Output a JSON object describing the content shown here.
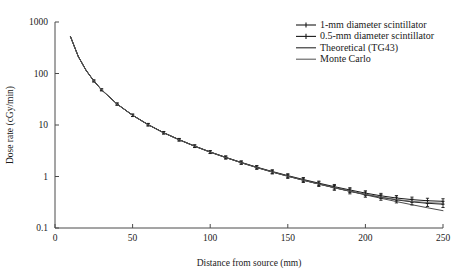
{
  "chart_data": {
    "type": "line",
    "title": "",
    "xlabel": "Distance from source (mm)",
    "ylabel": "Dose rate (cGy/min)",
    "xlim": [
      0,
      250
    ],
    "ylim": [
      0.1,
      1000
    ],
    "yscale": "log",
    "xscale": "linear",
    "grid": false,
    "xticks": [
      "0",
      "50",
      "100",
      "150",
      "200",
      "250"
    ],
    "xtick_values": [
      0,
      50,
      100,
      150,
      200,
      250
    ],
    "yticks": [
      "1000",
      "100",
      "10",
      "1",
      "0.1"
    ],
    "ytick_values": [
      1000,
      100,
      10,
      1,
      0.1
    ],
    "legend_position": "top-right",
    "legend": [
      "1-mm diameter scintillator",
      "0.5-mm diameter scintillator",
      "Theoretical (TG43)",
      "Monte Carlo"
    ],
    "series": [
      {
        "name": "1-mm diameter scintillator",
        "style": "line-with-errorbars",
        "color": "#1a1a1a",
        "x": [
          10,
          15,
          20,
          25,
          30,
          40,
          50,
          60,
          70,
          80,
          90,
          100,
          110,
          120,
          130,
          140,
          150,
          160,
          170,
          180,
          190,
          200,
          210,
          220,
          230,
          240,
          250
        ],
        "y": [
          520,
          215,
          116,
          72,
          48.5,
          25.6,
          15.5,
          10.2,
          7.1,
          5.2,
          3.9,
          3.0,
          2.36,
          1.88,
          1.52,
          1.25,
          1.04,
          0.875,
          0.742,
          0.635,
          0.548,
          0.476,
          0.422,
          0.382,
          0.356,
          0.338,
          0.33
        ],
        "yerr": [
          0,
          0,
          0,
          3.0,
          2.0,
          1.2,
          0.8,
          0.55,
          0.38,
          0.28,
          0.22,
          0.18,
          0.15,
          0.13,
          0.11,
          0.1,
          0.09,
          0.08,
          0.072,
          0.065,
          0.058,
          0.052,
          0.048,
          0.045,
          0.042,
          0.04,
          0.04
        ]
      },
      {
        "name": "0.5-mm diameter scintillator",
        "style": "line-with-errorbars",
        "color": "#1a1a1a",
        "x": [
          10,
          15,
          20,
          25,
          30,
          40,
          50,
          60,
          70,
          80,
          90,
          100,
          110,
          120,
          130,
          140,
          150,
          160,
          170,
          180,
          190,
          200,
          210,
          220,
          230,
          240,
          250
        ],
        "y": [
          515,
          213,
          115,
          71.5,
          48.0,
          25.4,
          15.4,
          10.1,
          7.05,
          5.15,
          3.87,
          2.97,
          2.33,
          1.85,
          1.49,
          1.22,
          1.01,
          0.845,
          0.712,
          0.605,
          0.518,
          0.448,
          0.394,
          0.352,
          0.322,
          0.302,
          0.29
        ],
        "yerr": [
          0,
          0,
          0,
          3.0,
          2.0,
          1.2,
          0.8,
          0.55,
          0.38,
          0.28,
          0.22,
          0.18,
          0.15,
          0.13,
          0.11,
          0.1,
          0.09,
          0.08,
          0.072,
          0.065,
          0.058,
          0.052,
          0.048,
          0.045,
          0.042,
          0.04,
          0.04
        ]
      },
      {
        "name": "Theoretical (TG43)",
        "style": "line",
        "color": "#2a2a2a",
        "x": [
          10,
          15,
          20,
          25,
          30,
          40,
          50,
          60,
          70,
          80,
          90,
          100,
          110,
          120,
          130,
          140,
          150,
          160,
          170,
          180,
          190,
          200,
          210,
          220,
          230,
          240,
          250
        ],
        "y": [
          518,
          214,
          115.5,
          71.8,
          48.2,
          25.5,
          15.45,
          10.15,
          7.08,
          5.18,
          3.88,
          2.98,
          2.34,
          1.86,
          1.5,
          1.23,
          1.02,
          0.852,
          0.716,
          0.606,
          0.516,
          0.44,
          0.378,
          0.326,
          0.283,
          0.247,
          0.217
        ]
      },
      {
        "name": "Monte Carlo",
        "style": "line",
        "color": "#5e5e5e",
        "x": [
          10,
          15,
          20,
          25,
          30,
          40,
          50,
          60,
          70,
          80,
          90,
          100,
          110,
          120,
          130,
          140,
          150,
          160,
          170,
          180,
          190,
          200,
          210,
          220,
          230,
          240,
          250
        ],
        "y": [
          516,
          213.5,
          115.2,
          71.6,
          48.1,
          25.45,
          15.42,
          10.12,
          7.06,
          5.16,
          3.875,
          2.975,
          2.335,
          1.855,
          1.495,
          1.225,
          1.015,
          0.848,
          0.714,
          0.608,
          0.522,
          0.452,
          0.398,
          0.358,
          0.33,
          0.312,
          0.302
        ]
      }
    ]
  },
  "plot_geometry": {
    "left": 55,
    "right": 443,
    "top": 22,
    "bottom": 228
  }
}
